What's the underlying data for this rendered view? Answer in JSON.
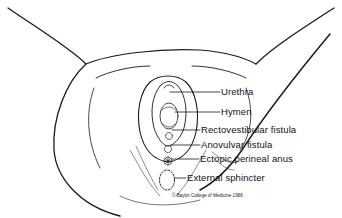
{
  "diagram": {
    "labels": [
      {
        "id": "urethra",
        "text": "Urethra"
      },
      {
        "id": "hymen",
        "text": "Hymen"
      },
      {
        "id": "rectovestibular-fistula",
        "text": "Rectovestibular fistula"
      },
      {
        "id": "anovulvar-fistula",
        "text": "Anovulvar fistula"
      },
      {
        "id": "ectopic-perineal-anus",
        "text": "Ectopic perineal anus"
      },
      {
        "id": "external-sphincter",
        "text": "External sphincter"
      }
    ],
    "credit": "© Baylor College of Medicine  1986",
    "line_color": "#1a1a1a",
    "background": "#ffffff"
  }
}
